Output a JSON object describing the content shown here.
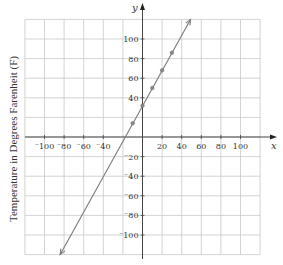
{
  "chart_data": {
    "type": "line",
    "title": "",
    "xlabel": "x",
    "ylabel": "Temperature in Degrees Farenheit (F)",
    "y_axis_letter": "y",
    "xlim": [
      -120,
      120
    ],
    "ylim": [
      -120,
      120
    ],
    "grid": true,
    "legend": null,
    "x_ticks": [
      -100,
      -80,
      -60,
      -40,
      20,
      40,
      60,
      80,
      100
    ],
    "x_tick_labels": [
      "⁻100",
      "⁻80",
      "⁻60",
      "⁻40",
      "20",
      "40",
      "60",
      "80",
      "100"
    ],
    "y_ticks": [
      100,
      80,
      60,
      40,
      -20,
      -40,
      -60,
      -80,
      -100
    ],
    "y_tick_labels": [
      "100",
      "80",
      "60",
      "40",
      "⁻20",
      "⁻40",
      "⁻60",
      "⁻80",
      "⁻100"
    ],
    "series": [
      {
        "name": "F = 1.8x + 32",
        "line": {
          "x_start": -84,
          "y_start": -120,
          "x_end": 49,
          "y_end": 120,
          "arrows": "both"
        },
        "points": {
          "x": [
            -10,
            0,
            10,
            20,
            30
          ],
          "y": [
            14,
            32,
            50,
            68,
            86
          ]
        }
      }
    ],
    "colors": {
      "line": "#7a7a7a",
      "grid": "#c8c8c8",
      "axis": "#444444",
      "point": "#8a8a8a"
    }
  }
}
